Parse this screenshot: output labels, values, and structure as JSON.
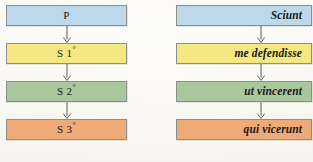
{
  "diagram": {
    "type": "flow-chart",
    "title": "",
    "orientation": "vertical",
    "columns": [
      {
        "id": "left",
        "name": "abstract-sequence",
        "nodes": [
          {
            "label": "P",
            "suffix": "",
            "color": "#bcd8ea",
            "border": "#8d8f8b"
          },
          {
            "label": "S 1",
            "suffix": "°",
            "color": "#f5e882",
            "border": "#8d8f8b"
          },
          {
            "label": "S 2",
            "suffix": "°",
            "color": "#a9c79c",
            "border": "#8d8f8b"
          },
          {
            "label": "S 3",
            "suffix": "°",
            "color": "#eeaa77",
            "border": "#8d8f8b"
          }
        ]
      },
      {
        "id": "right",
        "name": "latin-example-sequence",
        "nodes": [
          {
            "label": "Sciunt",
            "suffix": "",
            "color": "#bcd8ea",
            "border": "#8d8f8b"
          },
          {
            "label": "me defendisse",
            "suffix": "",
            "color": "#f5e882",
            "border": "#8d8f8b"
          },
          {
            "label": "ut vincerent",
            "suffix": "",
            "color": "#a9c79c",
            "border": "#8d8f8b"
          },
          {
            "label": "qui vicerunt",
            "suffix": "",
            "color": "#eeaa77",
            "border": "#8d8f8b"
          }
        ]
      }
    ],
    "connectors": {
      "icon": "down-arrow-icon",
      "color": "#4a4a46",
      "count_per_column": 3
    },
    "background_color": "#fbfaf6"
  }
}
